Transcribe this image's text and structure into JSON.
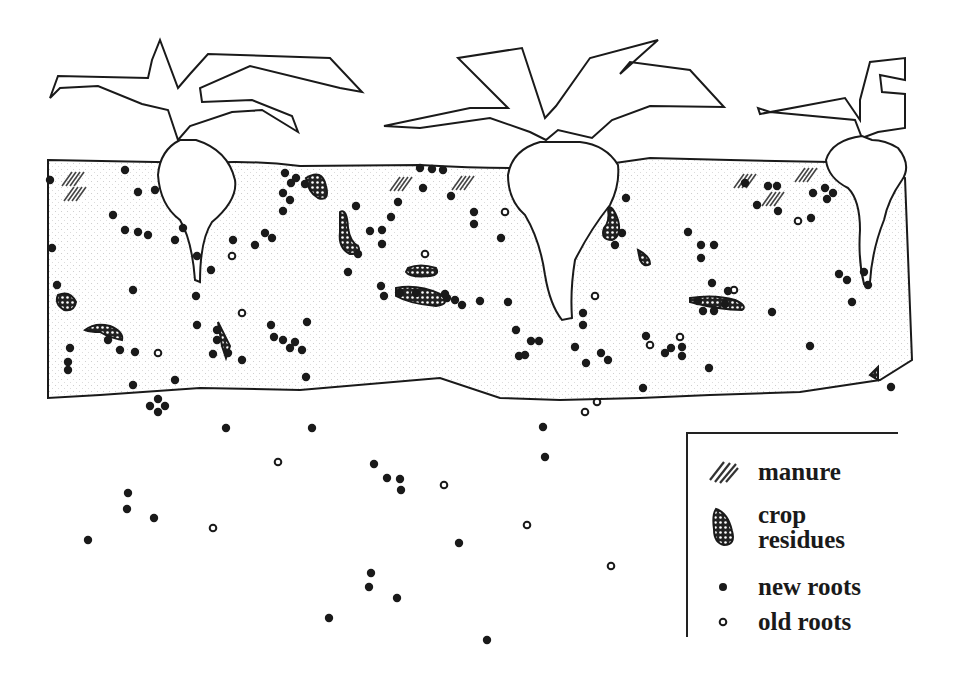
{
  "diagram": {
    "colors": {
      "ink": "#1a1a1a",
      "soil_stipple": "#c8c8c8",
      "background": "#ffffff"
    }
  },
  "legend": {
    "items": [
      {
        "symbol": "manure-hatch",
        "label": "manure"
      },
      {
        "symbol": "crop-residue-blob",
        "label_line1": "crop",
        "label_line2": "residues"
      },
      {
        "symbol": "filled-dot",
        "label": "new roots"
      },
      {
        "symbol": "open-dot",
        "label": "old roots"
      }
    ]
  },
  "new_roots": [
    [
      50,
      180
    ],
    [
      52,
      248
    ],
    [
      57,
      285
    ],
    [
      70,
      348
    ],
    [
      68,
      362
    ],
    [
      68,
      370
    ],
    [
      125,
      170
    ],
    [
      138,
      192
    ],
    [
      155,
      190
    ],
    [
      113,
      215
    ],
    [
      125,
      230
    ],
    [
      138,
      232
    ],
    [
      148,
      235
    ],
    [
      133,
      290
    ],
    [
      108,
      340
    ],
    [
      120,
      350
    ],
    [
      135,
      352
    ],
    [
      175,
      380
    ],
    [
      133,
      385
    ],
    [
      175,
      240
    ],
    [
      183,
      228
    ],
    [
      197,
      256
    ],
    [
      196,
      296
    ],
    [
      211,
      270
    ],
    [
      217,
      330
    ],
    [
      217,
      340
    ],
    [
      228,
      353
    ],
    [
      242,
      360
    ],
    [
      213,
      354
    ],
    [
      233,
      240
    ],
    [
      255,
      245
    ],
    [
      265,
      233
    ],
    [
      272,
      238
    ],
    [
      285,
      173
    ],
    [
      291,
      183
    ],
    [
      296,
      178
    ],
    [
      283,
      193
    ],
    [
      290,
      200
    ],
    [
      283,
      211
    ],
    [
      305,
      184
    ],
    [
      274,
      337
    ],
    [
      271,
      325
    ],
    [
      283,
      340
    ],
    [
      290,
      348
    ],
    [
      302,
      350
    ],
    [
      295,
      342
    ],
    [
      306,
      377
    ],
    [
      197,
      325
    ],
    [
      307,
      322
    ],
    [
      356,
      206
    ],
    [
      370,
      231
    ],
    [
      382,
      230
    ],
    [
      382,
      244
    ],
    [
      358,
      254
    ],
    [
      348,
      272
    ],
    [
      391,
      217
    ],
    [
      398,
      202
    ],
    [
      381,
      286
    ],
    [
      384,
      296
    ],
    [
      400,
      293
    ],
    [
      420,
      168
    ],
    [
      432,
      169
    ],
    [
      443,
      170
    ],
    [
      423,
      188
    ],
    [
      451,
      196
    ],
    [
      474,
      212
    ],
    [
      474,
      224
    ],
    [
      501,
      238
    ],
    [
      447,
      298
    ],
    [
      455,
      300
    ],
    [
      462,
      305
    ],
    [
      480,
      301
    ],
    [
      508,
      302
    ],
    [
      416,
      293
    ],
    [
      445,
      294
    ],
    [
      516,
      330
    ],
    [
      531,
      341
    ],
    [
      539,
      341
    ],
    [
      519,
      356
    ],
    [
      525,
      355
    ],
    [
      575,
      347
    ],
    [
      586,
      363
    ],
    [
      601,
      353
    ],
    [
      608,
      360
    ],
    [
      583,
      325
    ],
    [
      583,
      313
    ],
    [
      626,
      198
    ],
    [
      622,
      233
    ],
    [
      615,
      245
    ],
    [
      646,
      336
    ],
    [
      671,
      348
    ],
    [
      665,
      353
    ],
    [
      682,
      347
    ],
    [
      682,
      356
    ],
    [
      709,
      368
    ],
    [
      772,
      312
    ],
    [
      810,
      346
    ],
    [
      643,
      388
    ],
    [
      688,
      232
    ],
    [
      701,
      245
    ],
    [
      714,
      245
    ],
    [
      701,
      258
    ],
    [
      712,
      283
    ],
    [
      698,
      301
    ],
    [
      703,
      311
    ],
    [
      714,
      311
    ],
    [
      725,
      304
    ],
    [
      728,
      291
    ],
    [
      745,
      183
    ],
    [
      768,
      186
    ],
    [
      777,
      186
    ],
    [
      757,
      205
    ],
    [
      778,
      211
    ],
    [
      813,
      193
    ],
    [
      825,
      188
    ],
    [
      833,
      193
    ],
    [
      827,
      199
    ],
    [
      811,
      218
    ],
    [
      839,
      274
    ],
    [
      847,
      280
    ],
    [
      864,
      272
    ],
    [
      868,
      285
    ],
    [
      852,
      302
    ],
    [
      891,
      387
    ],
    [
      150,
      406
    ],
    [
      158,
      412
    ],
    [
      165,
      406
    ],
    [
      158,
      399
    ],
    [
      226,
      428
    ],
    [
      312,
      428
    ],
    [
      374,
      464
    ],
    [
      387,
      478
    ],
    [
      400,
      479
    ],
    [
      401,
      490
    ],
    [
      128,
      493
    ],
    [
      127,
      509
    ],
    [
      154,
      518
    ],
    [
      88,
      540
    ],
    [
      543,
      427
    ],
    [
      545,
      457
    ],
    [
      459,
      543
    ],
    [
      371,
      573
    ],
    [
      369,
      587
    ],
    [
      397,
      598
    ],
    [
      329,
      618
    ],
    [
      487,
      640
    ]
  ],
  "old_roots": [
    [
      242,
      313
    ],
    [
      158,
      353
    ],
    [
      232,
      256
    ],
    [
      505,
      212
    ],
    [
      425,
      254
    ],
    [
      595,
      296
    ],
    [
      597,
      402
    ],
    [
      650,
      345
    ],
    [
      680,
      337
    ],
    [
      734,
      290
    ],
    [
      798,
      221
    ],
    [
      278,
      462
    ],
    [
      444,
      485
    ],
    [
      213,
      528
    ],
    [
      527,
      525
    ],
    [
      611,
      566
    ],
    [
      585,
      412
    ]
  ],
  "crop_residues": [
    {
      "path": "M306 178 Q322 168 326 186 Q330 202 318 198 Q308 192 306 178 Z"
    },
    {
      "path": "M340 212 Q347 208 348 228 Q350 242 358 246 Q362 254 350 254 Q338 248 340 232 Z"
    },
    {
      "path": "M408 268 Q420 263 436 268 Q440 275 430 276 Q410 278 406 272 Z"
    },
    {
      "path": "M396 288 Q418 284 440 294 Q452 304 436 306 Q410 304 396 296 Z"
    },
    {
      "path": "M608 208 Q612 204 618 220 Q622 236 612 240 Q600 240 604 228 Q610 222 608 208 Z"
    },
    {
      "path": "M638 250 Q650 256 650 264 Q644 268 640 260 Z"
    },
    {
      "path": "M690 298 Q715 294 735 300 Q748 306 742 310 Q720 310 690 302 Z"
    },
    {
      "path": "M58 295 Q70 290 76 302 Q74 312 64 310 Q54 304 58 295 Z"
    },
    {
      "path": "M85 330 Q95 322 110 326 Q124 332 122 340 Q110 338 100 332 Q90 332 85 330 Z"
    },
    {
      "path": "M218 322 L230 346 L226 358 L222 346 Z"
    },
    {
      "path": "M870 375 L878 367 L878 380 Z"
    }
  ],
  "manure_patches": [
    [
      70,
      178
    ],
    [
      72,
      193
    ],
    [
      398,
      183
    ],
    [
      460,
      182
    ],
    [
      742,
      180
    ],
    [
      770,
      198
    ],
    [
      803,
      174
    ]
  ]
}
